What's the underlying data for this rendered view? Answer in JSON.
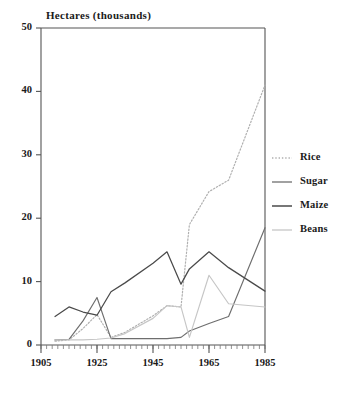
{
  "chart_data": {
    "type": "line",
    "title": "Hectares (thousands)",
    "xlabel": "",
    "ylabel": "Hectares (thousands)",
    "xlim": [
      1905,
      1985
    ],
    "ylim": [
      0,
      50
    ],
    "grid": false,
    "legend_position": "right",
    "x_ticks": [
      "1905",
      "1925",
      "1945",
      "1965",
      "1985"
    ],
    "y_ticks": [
      "0",
      "10",
      "20",
      "30",
      "40",
      "50"
    ],
    "x_tick_values": [
      1905,
      1925,
      1945,
      1965,
      1985
    ],
    "y_tick_values": [
      0,
      10,
      20,
      30,
      40,
      50
    ],
    "x_minor_tick_step": 2,
    "series": [
      {
        "name": "Rice",
        "style": "dotted",
        "color": "#b0b0b0",
        "x": [
          1910,
          1915,
          1920,
          1925,
          1930,
          1935,
          1945,
          1950,
          1955,
          1958,
          1965,
          1972,
          1985
        ],
        "values": [
          0.6,
          0.8,
          2.6,
          4.8,
          1.2,
          2.0,
          4.6,
          6.2,
          6.0,
          19.0,
          24.2,
          26.0,
          41.0
        ]
      },
      {
        "name": "Sugar",
        "style": "solid",
        "color": "#6e6e6e",
        "x": [
          1910,
          1915,
          1920,
          1925,
          1930,
          1935,
          1945,
          1950,
          1955,
          1958,
          1965,
          1972,
          1985
        ],
        "values": [
          0.8,
          0.9,
          3.8,
          7.5,
          1.0,
          1.0,
          1.0,
          1.0,
          1.2,
          2.2,
          3.4,
          4.5,
          18.5
        ]
      },
      {
        "name": "Maize",
        "style": "solid",
        "color": "#4a4a4a",
        "x": [
          1910,
          1915,
          1920,
          1925,
          1930,
          1935,
          1945,
          1950,
          1955,
          1958,
          1965,
          1972,
          1985
        ],
        "values": [
          4.5,
          6.0,
          5.2,
          4.7,
          8.4,
          9.8,
          12.9,
          14.7,
          9.6,
          12.0,
          14.7,
          12.2,
          8.5
        ]
      },
      {
        "name": "Beans",
        "style": "solid",
        "color": "#c6c6c6",
        "x": [
          1910,
          1915,
          1920,
          1925,
          1930,
          1935,
          1945,
          1950,
          1955,
          1958,
          1965,
          1972,
          1985
        ],
        "values": [
          0.8,
          0.8,
          0.8,
          0.9,
          1.1,
          1.8,
          4.2,
          6.2,
          6.0,
          1.2,
          11.0,
          6.5,
          6.0
        ]
      }
    ]
  },
  "legend": {
    "entries": [
      {
        "label": "Rice"
      },
      {
        "label": "Sugar"
      },
      {
        "label": "Maize"
      },
      {
        "label": "Beans"
      }
    ]
  }
}
